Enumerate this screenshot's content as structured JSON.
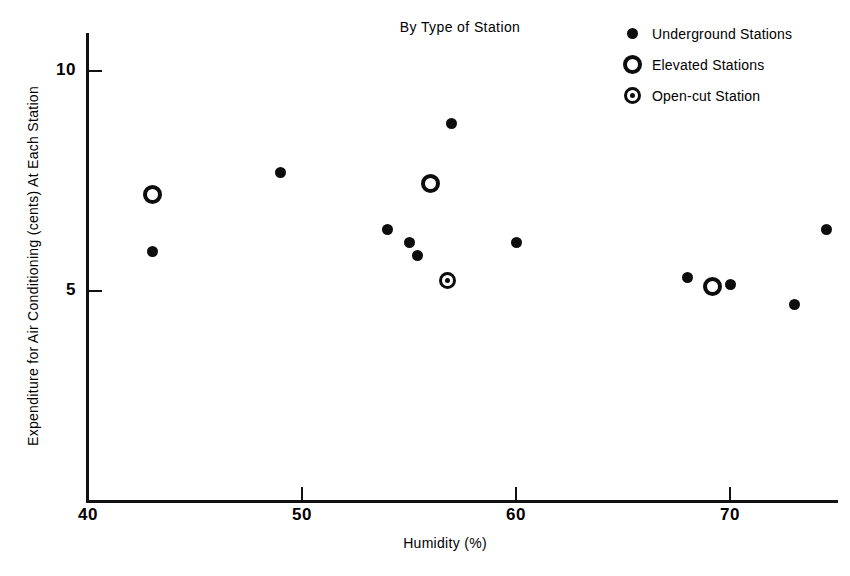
{
  "chart_data": {
    "type": "scatter",
    "title": "By Type of Station",
    "xlabel": "Humidity (%)",
    "ylabel": "Expenditure for Air Conditioning (cents) At Each Station",
    "xlim": [
      40,
      75
    ],
    "ylim": [
      3.4,
      10.6
    ],
    "xticks": [
      40,
      50,
      60,
      70
    ],
    "yticks": [
      5,
      10
    ],
    "xtick_labels": [
      "40",
      "50",
      "60",
      "70"
    ],
    "ytick_labels": [
      "5",
      "10"
    ],
    "grid": false,
    "legend_position": "top-right",
    "series": [
      {
        "name": "Underground Stations",
        "marker": "filled-circle",
        "points": [
          {
            "x": 43.0,
            "y": 5.9
          },
          {
            "x": 49.0,
            "y": 7.7
          },
          {
            "x": 54.0,
            "y": 6.4
          },
          {
            "x": 55.0,
            "y": 6.1
          },
          {
            "x": 55.4,
            "y": 5.8
          },
          {
            "x": 57.0,
            "y": 8.8
          },
          {
            "x": 60.0,
            "y": 6.1
          },
          {
            "x": 68.0,
            "y": 5.3
          },
          {
            "x": 70.0,
            "y": 5.15
          },
          {
            "x": 73.0,
            "y": 4.7
          },
          {
            "x": 74.5,
            "y": 6.4
          }
        ]
      },
      {
        "name": "Elevated Stations",
        "marker": "open-circle",
        "points": [
          {
            "x": 43.0,
            "y": 7.2
          },
          {
            "x": 56.0,
            "y": 7.45
          },
          {
            "x": 69.2,
            "y": 5.1
          }
        ]
      },
      {
        "name": "Open-cut Station",
        "marker": "circle-with-dot",
        "points": [
          {
            "x": 56.8,
            "y": 5.25
          }
        ]
      }
    ]
  },
  "legend": {
    "items": [
      {
        "label": "Underground Stations",
        "marker": "filled-circle"
      },
      {
        "label": "Elevated Stations",
        "marker": "open-circle"
      },
      {
        "label": "Open-cut Station",
        "marker": "circle-with-dot"
      }
    ]
  },
  "colors": {
    "ink": "#0d0d0d",
    "background": "#ffffff"
  }
}
